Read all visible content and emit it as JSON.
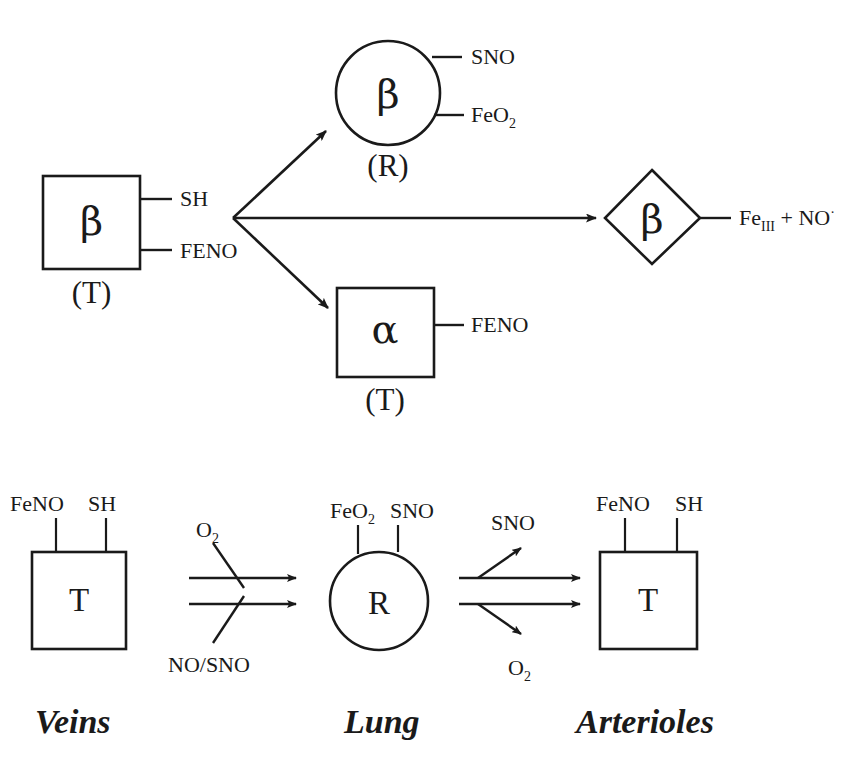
{
  "figure": {
    "background_color": "#ffffff",
    "ink_color": "#1a1a1a"
  },
  "top_panel": {
    "source_node": {
      "shape": "square",
      "subunit": "β",
      "state": "(T)",
      "ligands": [
        "SH",
        "FENO"
      ]
    },
    "branch_up_node": {
      "shape": "circle",
      "subunit": "β",
      "state": "(R)",
      "ligands": [
        "SNO",
        "FeO",
        "2"
      ],
      "ligand_sno": "SNO",
      "ligand_feo2_base": "FeO",
      "ligand_feo2_sub": "2"
    },
    "branch_down_node": {
      "shape": "square",
      "subunit": "α",
      "state": "(T)",
      "ligands": [
        "FENO"
      ],
      "ligand_feno": "FENO"
    },
    "branch_right_node": {
      "shape": "diamond",
      "subunit": "β",
      "product_base": "Fe",
      "product_sub": "III",
      "product_tail": " + NO",
      "product_radical": "·"
    }
  },
  "bottom_panel": {
    "regions": [
      {
        "caption": "Veins",
        "node_shape": "square",
        "node_letter": "T",
        "stem_labels": [
          "FeNO",
          "SH"
        ]
      },
      {
        "caption": "Lung",
        "node_shape": "circle",
        "node_letter": "R",
        "stem_labels": [
          "FeO",
          "SNO"
        ],
        "stem_label_feo2_base": "FeO",
        "stem_label_feo2_sub": "2",
        "stem_label_sno": "SNO"
      },
      {
        "caption": "Arterioles",
        "node_shape": "square",
        "node_letter": "T",
        "stem_labels": [
          "FeNO",
          "SH"
        ]
      }
    ],
    "transition_veins_to_lung": {
      "inflow_top_base": "O",
      "inflow_top_sub": "2",
      "inflow_bottom": "NO/SNO",
      "arrow_count": 2,
      "direction": "right"
    },
    "transition_lung_to_arterioles": {
      "outflow_top": "SNO",
      "outflow_bottom_base": "O",
      "outflow_bottom_sub": "2",
      "arrow_count": 2,
      "direction": "right"
    }
  }
}
